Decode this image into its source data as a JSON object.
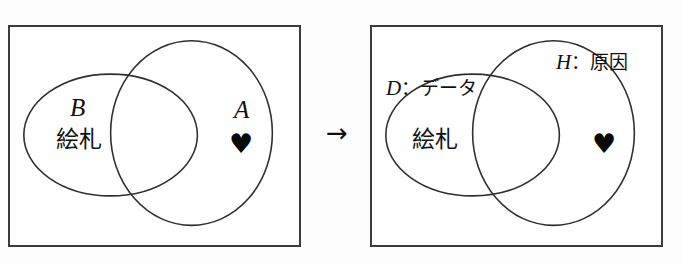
{
  "figure": {
    "background_color": "#fdfdfd",
    "stroke_color": "#2f2f2f",
    "panel_border_color": "#3c3c3c"
  },
  "transition": {
    "arrow_glyph": "→"
  },
  "panels": [
    {
      "id": "before",
      "shapes": {
        "ellipse": {
          "label": "B",
          "sublabel": "絵札"
        },
        "circle": {
          "label": "A",
          "symbol": "♥"
        }
      }
    },
    {
      "id": "after",
      "shapes": {
        "ellipse": {
          "label": "D：データ",
          "label_latin": "D",
          "label_separator": "：",
          "label_jp": "データ",
          "sublabel": "絵札"
        },
        "circle": {
          "label": "H：原因",
          "label_latin": "H",
          "label_separator": "：",
          "label_jp": "原因",
          "symbol": "♥"
        }
      }
    }
  ],
  "labels": {
    "B": "B",
    "B_jp": "絵札",
    "A": "A",
    "heart": "♥",
    "D_latin": "D",
    "D_sep": "：",
    "D_jp": "データ",
    "D_sublabel": "絵札",
    "H_latin": "H",
    "H_sep": "：",
    "H_jp": "原因"
  }
}
